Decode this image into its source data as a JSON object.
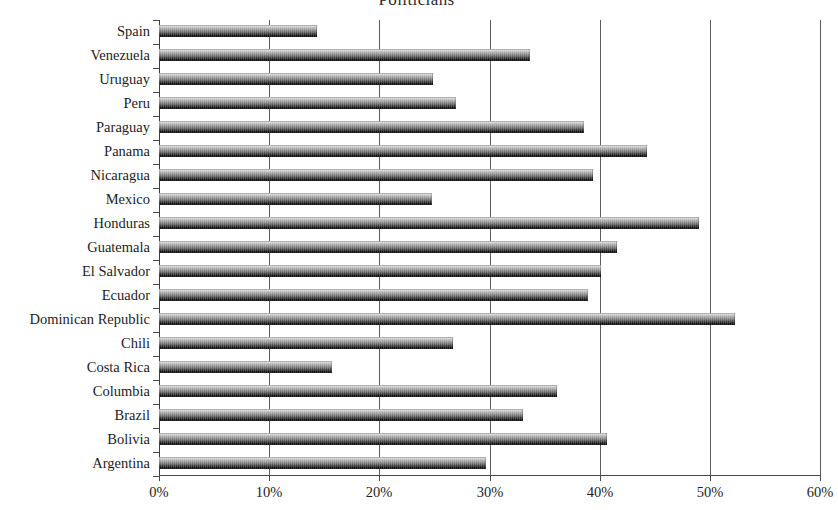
{
  "chart_data": {
    "type": "bar",
    "orientation": "horizontal",
    "title": "Politicians",
    "xlabel": "",
    "ylabel": "",
    "xlim": [
      0,
      60
    ],
    "x_unit": "%",
    "xticks": [
      "0%",
      "10%",
      "20%",
      "30%",
      "40%",
      "50%",
      "60%"
    ],
    "xtick_values": [
      0,
      10,
      20,
      30,
      40,
      50,
      60
    ],
    "grid": "vertical",
    "legend": "none",
    "categories": [
      "Spain",
      "Venezuela",
      "Uruguay",
      "Peru",
      "Paraguay",
      "Panama",
      "Nicaragua",
      "Mexico",
      "Honduras",
      "Guatemala",
      "El Salvador",
      "Ecuador",
      "Dominican Republic",
      "Chili",
      "Costa Rica",
      "Columbia",
      "Brazil",
      "Bolivia",
      "Argentina"
    ],
    "values": [
      14.3,
      33.7,
      24.9,
      27.0,
      38.6,
      44.3,
      39.4,
      24.8,
      49.0,
      41.6,
      40.1,
      38.9,
      52.3,
      26.7,
      15.7,
      36.1,
      33.0,
      40.7,
      29.7
    ]
  },
  "style": {
    "bar_dark": "#070707",
    "bar_light": "#efefef",
    "gridline_color": "#5c5c5c",
    "axis_color": "#4a4a4a",
    "text_color": "#1d1d1d",
    "background": "#ffffff"
  }
}
